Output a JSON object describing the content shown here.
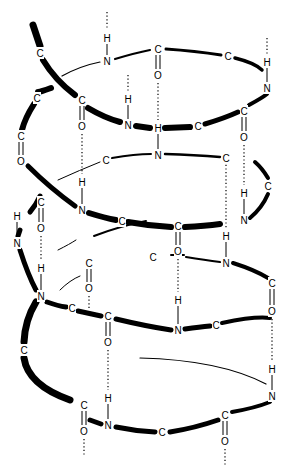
{
  "diagram": {
    "atoms": [
      {
        "id": "a1",
        "el": "H",
        "x": 107,
        "y": 38
      },
      {
        "id": "a2",
        "el": "N",
        "x": 107,
        "y": 61
      },
      {
        "id": "a3",
        "el": "C",
        "x": 158,
        "y": 49
      },
      {
        "id": "a4",
        "el": "O",
        "x": 158,
        "y": 75
      },
      {
        "id": "a5",
        "el": "C",
        "x": 228,
        "y": 56
      },
      {
        "id": "a6",
        "el": "H",
        "x": 267,
        "y": 62
      },
      {
        "id": "a7",
        "el": "N",
        "x": 267,
        "y": 88
      },
      {
        "id": "a8",
        "el": "C",
        "x": 40,
        "y": 53
      },
      {
        "id": "a9",
        "el": "C",
        "x": 37,
        "y": 98
      },
      {
        "id": "a10",
        "el": "C",
        "x": 82,
        "y": 100
      },
      {
        "id": "a11",
        "el": "O",
        "x": 82,
        "y": 126
      },
      {
        "id": "a12",
        "el": "H",
        "x": 128,
        "y": 99
      },
      {
        "id": "a13",
        "el": "N",
        "x": 128,
        "y": 125
      },
      {
        "id": "a14",
        "el": "H",
        "x": 158,
        "y": 128
      },
      {
        "id": "a15",
        "el": "C",
        "x": 198,
        "y": 126
      },
      {
        "id": "a16",
        "el": "C",
        "x": 244,
        "y": 111
      },
      {
        "id": "a17",
        "el": "O",
        "x": 244,
        "y": 137
      },
      {
        "id": "a18",
        "el": "C",
        "x": 21,
        "y": 136
      },
      {
        "id": "a19",
        "el": "O",
        "x": 21,
        "y": 161
      },
      {
        "id": "a20",
        "el": "C",
        "x": 106,
        "y": 160
      },
      {
        "id": "a21",
        "el": "N",
        "x": 158,
        "y": 155
      },
      {
        "id": "a22",
        "el": "C",
        "x": 226,
        "y": 158
      },
      {
        "id": "a23",
        "el": "C",
        "x": 268,
        "y": 186
      },
      {
        "id": "a24",
        "el": "H",
        "x": 82,
        "y": 182
      },
      {
        "id": "a25",
        "el": "N",
        "x": 82,
        "y": 210
      },
      {
        "id": "a26",
        "el": "C",
        "x": 41,
        "y": 202
      },
      {
        "id": "a27",
        "el": "O",
        "x": 41,
        "y": 228
      },
      {
        "id": "a28",
        "el": "C",
        "x": 122,
        "y": 221
      },
      {
        "id": "a29",
        "el": "C",
        "x": 178,
        "y": 226
      },
      {
        "id": "a30",
        "el": "O",
        "x": 178,
        "y": 251
      },
      {
        "id": "a31",
        "el": "H",
        "x": 244,
        "y": 193
      },
      {
        "id": "a32",
        "el": "N",
        "x": 244,
        "y": 220
      },
      {
        "id": "a33",
        "el": "H",
        "x": 17,
        "y": 216
      },
      {
        "id": "a34",
        "el": "N",
        "x": 17,
        "y": 243
      },
      {
        "id": "a35",
        "el": "H",
        "x": 226,
        "y": 236
      },
      {
        "id": "a36",
        "el": "N",
        "x": 226,
        "y": 263
      },
      {
        "id": "a37",
        "el": "C",
        "x": 153,
        "y": 257
      },
      {
        "id": "a38",
        "el": "C",
        "x": 89,
        "y": 263
      },
      {
        "id": "a39",
        "el": "O",
        "x": 89,
        "y": 288
      },
      {
        "id": "a40",
        "el": "H",
        "x": 41,
        "y": 268
      },
      {
        "id": "a41",
        "el": "N",
        "x": 41,
        "y": 296
      },
      {
        "id": "a42",
        "el": "C",
        "x": 72,
        "y": 308
      },
      {
        "id": "a43",
        "el": "C",
        "x": 108,
        "y": 316
      },
      {
        "id": "a44",
        "el": "O",
        "x": 108,
        "y": 342
      },
      {
        "id": "a45",
        "el": "C",
        "x": 272,
        "y": 283
      },
      {
        "id": "a46",
        "el": "O",
        "x": 272,
        "y": 311
      },
      {
        "id": "a47",
        "el": "H",
        "x": 178,
        "y": 300
      },
      {
        "id": "a48",
        "el": "N",
        "x": 178,
        "y": 330
      },
      {
        "id": "a49",
        "el": "C",
        "x": 216,
        "y": 325
      },
      {
        "id": "a50",
        "el": "C",
        "x": 24,
        "y": 350
      },
      {
        "id": "a51",
        "el": "H",
        "x": 272,
        "y": 369
      },
      {
        "id": "a52",
        "el": "N",
        "x": 272,
        "y": 396
      },
      {
        "id": "a53",
        "el": "H",
        "x": 108,
        "y": 398
      },
      {
        "id": "a54",
        "el": "N",
        "x": 108,
        "y": 425
      },
      {
        "id": "a55",
        "el": "C",
        "x": 84,
        "y": 405
      },
      {
        "id": "a56",
        "el": "O",
        "x": 84,
        "y": 431
      },
      {
        "id": "a57",
        "el": "C",
        "x": 162,
        "y": 432
      },
      {
        "id": "a58",
        "el": "C",
        "x": 225,
        "y": 415
      },
      {
        "id": "a59",
        "el": "O",
        "x": 225,
        "y": 441
      }
    ]
  }
}
